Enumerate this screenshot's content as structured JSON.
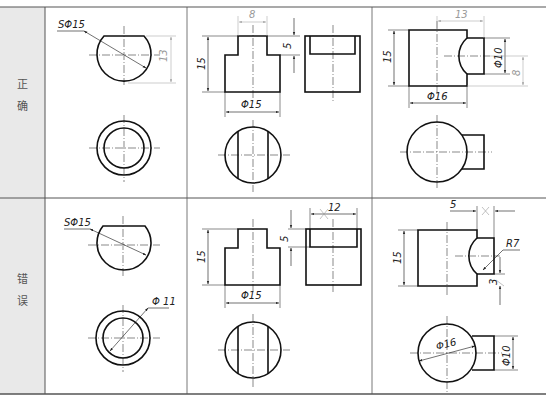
{
  "table": {
    "rows": [
      {
        "label_line1": "正",
        "label_line2": "确",
        "cells": [
          {
            "dims": {
              "sphere": "SΦ15",
              "height": "13"
            }
          },
          {
            "dims": {
              "top_width": "8",
              "step": "5",
              "height": "15",
              "diameter": "Φ15"
            }
          },
          {
            "dims": {
              "length": "13",
              "height": "15",
              "hole_dia": "Φ10",
              "offset": "8",
              "diameter": "Φ16"
            }
          }
        ]
      },
      {
        "label_line1": "错",
        "label_line2": "误",
        "cells": [
          {
            "dims": {
              "sphere": "SΦ15",
              "inner_dia": "Φ 11"
            }
          },
          {
            "dims": {
              "width": "12",
              "step": "5",
              "height": "15",
              "diameter": "Φ15"
            }
          },
          {
            "dims": {
              "offset": "5",
              "radius": "R7",
              "small": "3",
              "height": "15",
              "diameter": "Φ16",
              "hole_dia": "Φ10"
            }
          }
        ]
      }
    ]
  },
  "colors": {
    "label_bg": "#e9e9e9",
    "line": "#111111",
    "border": "#555555",
    "dim_light": "#999999"
  }
}
